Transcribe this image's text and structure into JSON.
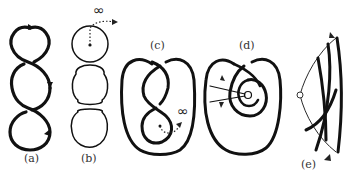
{
  "figure": {
    "panels": [
      {
        "id": "a",
        "label": "(a)",
        "description": "three-lobed twisted chain of loops with orientation arrows"
      },
      {
        "id": "b",
        "label": "(b)",
        "description": "three separate circles; top circle has point connected by dotted arc to infinity",
        "annotation": "∞"
      },
      {
        "id": "c",
        "label": "(c)",
        "description": "knot diagram with inner figure-eight strand; dotted arrow to infinity",
        "annotation": "∞"
      },
      {
        "id": "d",
        "label": "(d)",
        "description": "spiral knot diagram around a hollow point with two crossing rays and arrows"
      },
      {
        "id": "e",
        "label": "(e)",
        "description": "wedge sector with hollow vertex point and braided strands; arrows at top and bottom"
      }
    ]
  },
  "colors": {
    "stroke": "#111111",
    "label": "#333333",
    "background": "#ffffff"
  }
}
